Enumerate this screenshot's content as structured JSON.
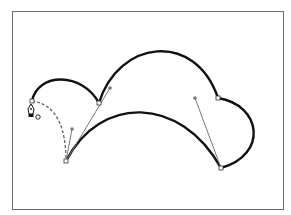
{
  "diagram": {
    "type": "bezier-path-illustration",
    "tool": "pen-tool",
    "colors": {
      "frame": "#6e6e6e",
      "path": "#111111",
      "handle_line": "#777777",
      "handle_point": "#777777",
      "anchor_fill": "#ffffff",
      "anchor_stroke": "#333333",
      "preview_path": "#555555"
    },
    "anchors": [
      {
        "id": "A",
        "x": 32,
        "y": 101
      },
      {
        "id": "B",
        "x": 99,
        "y": 103
      },
      {
        "id": "C",
        "x": 66,
        "y": 161
      },
      {
        "id": "D",
        "x": 218,
        "y": 98
      },
      {
        "id": "E",
        "x": 221,
        "y": 168
      }
    ],
    "handles": [
      {
        "anchor": "C",
        "x": 72,
        "y": 129
      },
      {
        "anchor": "C",
        "x": 110,
        "y": 88
      },
      {
        "anchor": "E",
        "x": 195,
        "y": 98
      }
    ],
    "cursor": {
      "icon": "pen-tool-close-path-icon",
      "x": 31,
      "y": 112
    }
  }
}
